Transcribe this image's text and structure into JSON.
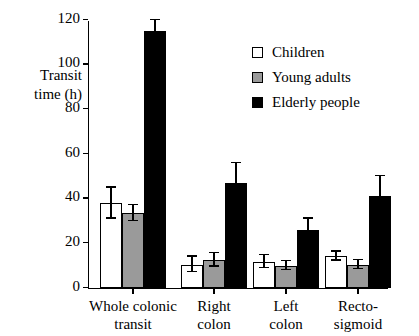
{
  "chart_data": {
    "type": "bar",
    "title": "",
    "xlabel": "",
    "ylabel_line1": "Transit",
    "ylabel_line2": "time (h)",
    "ylabel": "Transit time (h)",
    "ylim": [
      0,
      120
    ],
    "yticks": [
      0,
      20,
      40,
      60,
      80,
      100,
      120
    ],
    "ytick_labels": [
      "0",
      "20",
      "40",
      "60",
      "80",
      "100",
      "120"
    ],
    "grid": false,
    "legend_position": "upper-right-inside",
    "categories": [
      "Whole colonic transit",
      "Right colon",
      "Left colon",
      "Recto-sigmoid"
    ],
    "category_label_lines": [
      [
        "Whole colonic",
        "transit"
      ],
      [
        "Right",
        "colon"
      ],
      [
        "Left",
        "colon"
      ],
      [
        "Recto-",
        "sigmoid"
      ]
    ],
    "series": [
      {
        "name": "Children",
        "color": "#ffffff",
        "values": [
          38,
          10.5,
          11.8,
          14.2
        ],
        "errors": [
          7,
          3.5,
          3,
          2
        ]
      },
      {
        "name": "Young adults",
        "color": "#9a9a9a",
        "values": [
          33.5,
          12.5,
          10,
          10.5
        ],
        "errors": [
          3.5,
          3,
          2,
          2
        ]
      },
      {
        "name": "Elderly people",
        "color": "#000000",
        "values": [
          115,
          47,
          26,
          41
        ],
        "errors": [
          5,
          9,
          5,
          9
        ]
      }
    ]
  },
  "legend": {
    "items": [
      {
        "label": "Children",
        "swatch": "children"
      },
      {
        "label": "Young adults",
        "swatch": "young"
      },
      {
        "label": "Elderly people",
        "swatch": "elderly"
      }
    ]
  }
}
